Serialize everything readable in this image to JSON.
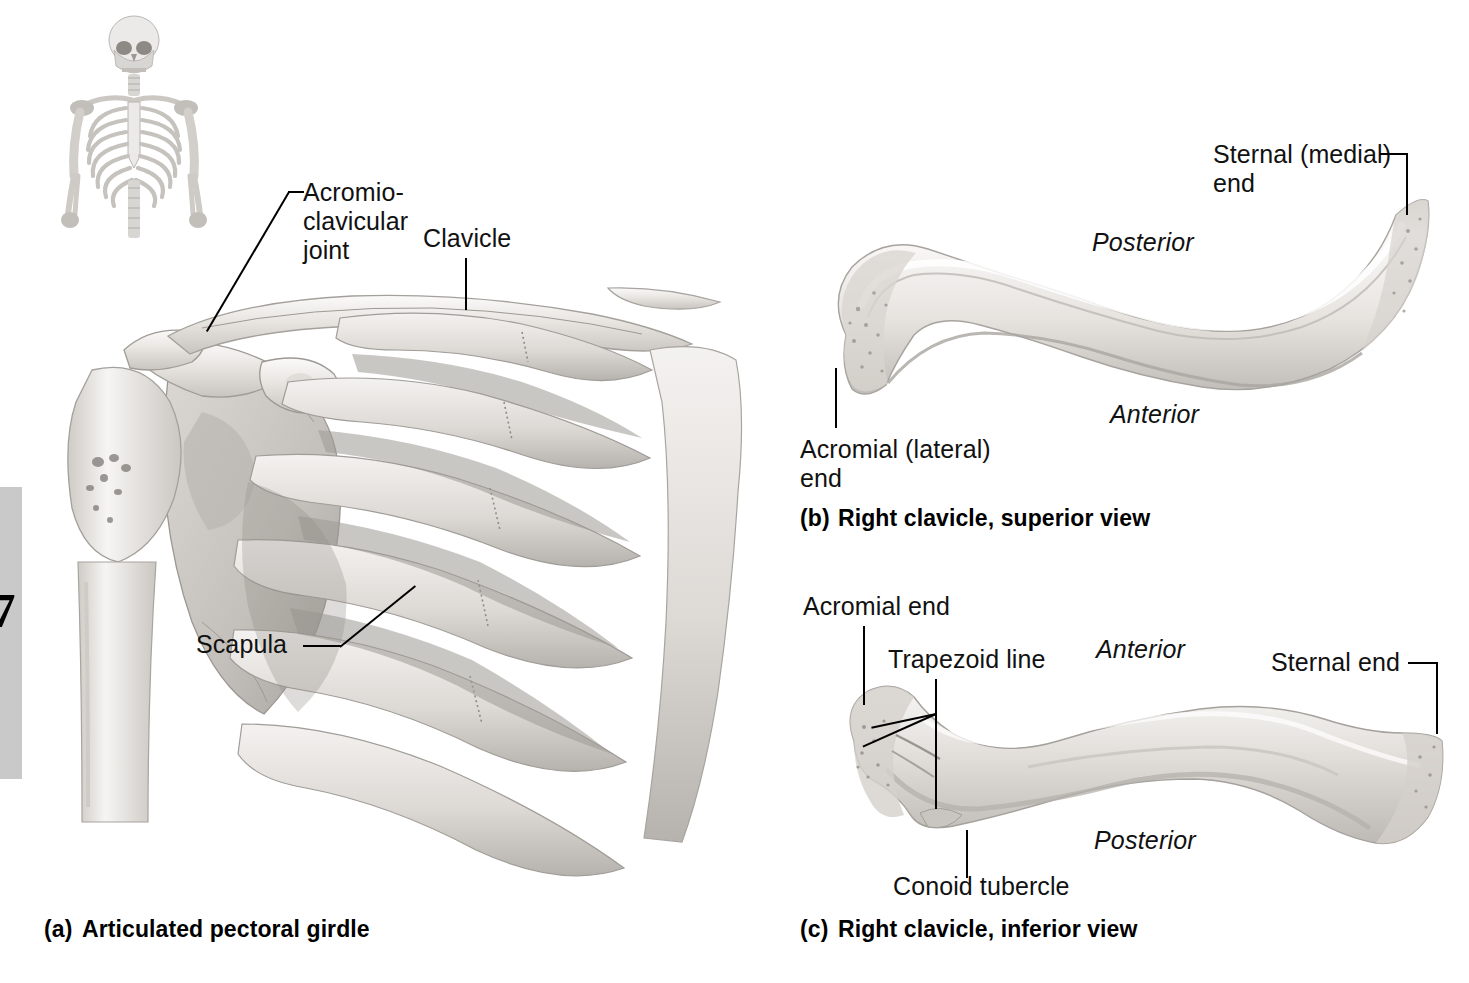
{
  "figure": {
    "page_tab_number": "7",
    "panels": [
      {
        "id": "a",
        "caption_letter": "(a)",
        "caption_text": "Articulated pectoral girdle",
        "labels": [
          {
            "name": "acromioclavicular-joint",
            "text": "Acromio-\nclavicular\njoint"
          },
          {
            "name": "clavicle",
            "text": "Clavicle"
          },
          {
            "name": "scapula",
            "text": "Scapula"
          }
        ]
      },
      {
        "id": "b",
        "caption_letter": "(b)",
        "caption_text": "Right clavicle, superior view",
        "labels": [
          {
            "name": "sternal-medial-end",
            "text": "Sternal (medial)\nend"
          },
          {
            "name": "acromial-lateral-end",
            "text": "Acromial (lateral)\nend"
          }
        ],
        "directions": [
          {
            "name": "posterior",
            "text": "Posterior"
          },
          {
            "name": "anterior",
            "text": "Anterior"
          }
        ]
      },
      {
        "id": "c",
        "caption_letter": "(c)",
        "caption_text": "Right clavicle, inferior view",
        "labels": [
          {
            "name": "acromial-end",
            "text": "Acromial end"
          },
          {
            "name": "trapezoid-line",
            "text": "Trapezoid line"
          },
          {
            "name": "conoid-tubercle",
            "text": "Conoid tubercle"
          },
          {
            "name": "sternal-end",
            "text": "Sternal end"
          }
        ],
        "directions": [
          {
            "name": "anterior",
            "text": "Anterior"
          },
          {
            "name": "posterior",
            "text": "Posterior"
          }
        ]
      }
    ],
    "inset": {
      "name": "skeleton-orientation-inset",
      "alt": "Upper-body skeleton orientation icon"
    },
    "colors": {
      "background": "#ffffff",
      "ink": "#111111",
      "bone_light": "#f7f6f5",
      "bone_mid": "#dedbd7",
      "bone_dark": "#a9a5a0",
      "tab_gray": "#c9c9c9"
    }
  }
}
